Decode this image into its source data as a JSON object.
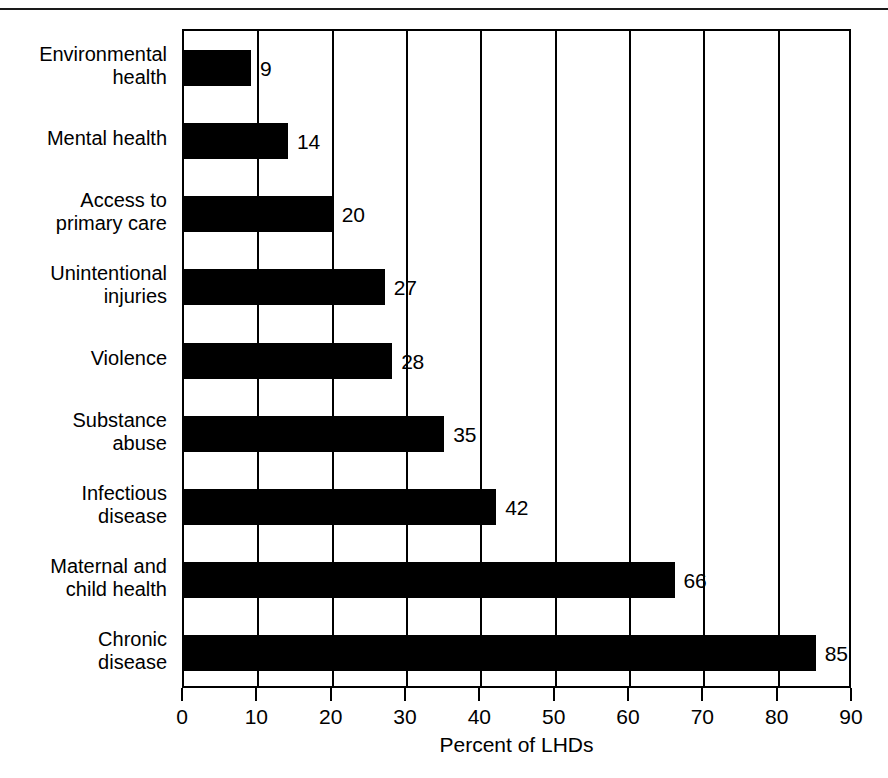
{
  "chart_data": {
    "type": "bar",
    "orientation": "horizontal",
    "title": "",
    "xlabel": "Percent of LHDs",
    "ylabel": "",
    "xlim": [
      0,
      90
    ],
    "xticks": [
      0,
      10,
      20,
      30,
      40,
      50,
      60,
      70,
      80,
      90
    ],
    "xtick_labels": [
      "0",
      "10",
      "20",
      "30",
      "40",
      "50",
      "60",
      "70",
      "80",
      "90"
    ],
    "grid": "vertical",
    "legend": "none",
    "bar_color": "#000000",
    "value_labels_shown": true,
    "categories": [
      "Environmental\nhealth",
      "Mental health",
      "Access to\nprimary care",
      "Unintentional\ninjuries",
      "Violence",
      "Substance\nabuse",
      "Infectious\ndisease",
      "Maternal and\nchild health",
      "Chronic\ndisease"
    ],
    "values": [
      9,
      14,
      20,
      27,
      28,
      35,
      42,
      66,
      85
    ],
    "value_label_texts": [
      "9",
      "14",
      "20",
      "27",
      "28",
      "35",
      "42",
      "66",
      "85"
    ]
  },
  "axis": {
    "x_title": "Percent of LHDs"
  }
}
